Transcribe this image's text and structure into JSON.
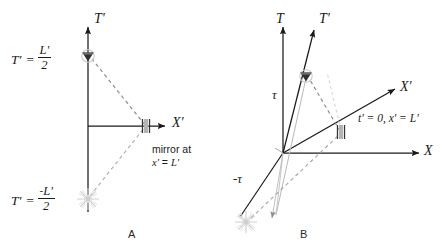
{
  "figure": {
    "title_text": "",
    "background_color": "#ffffff",
    "ink_color": "#1a1a1a",
    "light_ray_color": "#9a9a9a",
    "burst_color": "#c9c9c9",
    "mirror_color": "#9e9e9e"
  },
  "panelA": {
    "label": "A",
    "axes": {
      "vertical_label": "T'",
      "horizontal_label": "X'"
    },
    "event_top": {
      "axis_symbol": "T'",
      "equals": "=",
      "numerator": "L'",
      "denominator": "2",
      "sign": ""
    },
    "event_bottom": {
      "axis_symbol": "T'",
      "equals": "=",
      "numerator": "L'",
      "denominator": "2",
      "sign": "-"
    },
    "mirror_note_line1": "mirror at",
    "mirror_note_line2_x": "x'",
    "mirror_note_line2_eq": "=",
    "mirror_note_line2_L": "L'"
  },
  "panelB": {
    "label": "B",
    "axes": {
      "vertical_label": "T",
      "horizontal_label": "X",
      "primed_vertical_label": "T'",
      "primed_horizontal_label": "X'"
    },
    "tau_positive": "τ",
    "tau_negative": "-τ",
    "mirror_condition": "t' = 0, x' = L'"
  }
}
